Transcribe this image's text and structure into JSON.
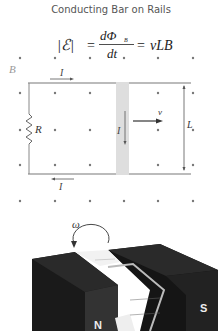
{
  "title": "Conducting Bar on Rails",
  "equation": {
    "lhs": "|ℰ|",
    "eq1": "=",
    "numerator": "dΦ",
    "subscript": "B",
    "denominator": "dt",
    "eq2": "=",
    "rhs": "vLB"
  },
  "circuit": {
    "field_label": "B",
    "current_top_label": "I",
    "current_bottom_label": "I",
    "current_bar_label": "I",
    "resistor_label": "R",
    "velocity_label": "v",
    "length_label": "L"
  },
  "generator": {
    "omega_label": "ω",
    "north_label": "N",
    "south_label": "S"
  }
}
